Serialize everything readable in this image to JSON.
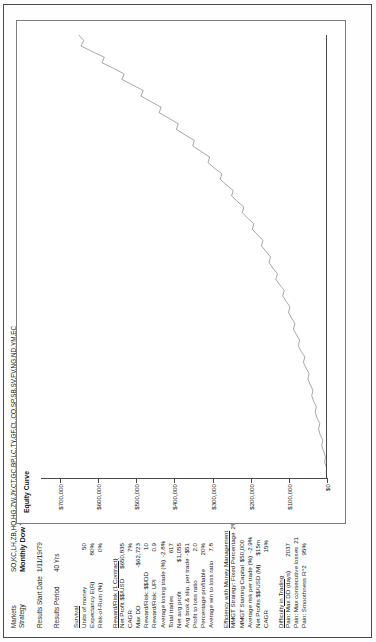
{
  "header": {
    "markets_label": "Markets",
    "markets_value": "SO,KC,LH,ZB,HO,HG,ZW,JY,CT,GC,BP,LC,TY,GF,CL,CO,SP,SB,SV,FV,NG,ND,YM,EC",
    "strategy_label": "Strategy",
    "strategy_value": "Monthly Dow Trader w/LF and 2 Stop Trade Plan",
    "results_start_date_label": "Results Start Date",
    "results_start_date_value": "1/11/19/79",
    "results_period_label": "Results Period",
    "results_period_value": "40 Yrs"
  },
  "stats": [
    {
      "title": "Survival",
      "rows": [
        {
          "label": "Units of money",
          "value": "50"
        },
        {
          "label": "Expectancy E(R)",
          "value": "80%"
        },
        {
          "label": "Risk-of-Ruin (%)",
          "value": "0%"
        }
      ]
    },
    {
      "title": "Reward/Risk (1 Contract)",
      "rows": [
        {
          "label": "Net Profit $$/USD",
          "value": "$650,835"
        },
        {
          "label": "CAGR",
          "value": "7%"
        },
        {
          "label": "Max DD",
          "value": "-$62,723"
        },
        {
          "label": "Reward/Risk: $$/DD",
          "value": "10"
        },
        {
          "label": "Reward/Risk: UPI",
          "value": "0.9"
        },
        {
          "label": "Average losing trade (%)",
          "value": "-2.8%"
        },
        {
          "label": "Total trades",
          "value": "617"
        },
        {
          "label": "Net avg profit",
          "value": "$1,055"
        },
        {
          "label": "Avg brok.& slip. per trade",
          "value": "-$51"
        },
        {
          "label": "Profit to loss ratio",
          "value": "2.0"
        },
        {
          "label": "Percentage profitable",
          "value": "20%"
        },
        {
          "label": "Average win to loss ratio",
          "value": "7.8"
        }
      ]
    },
    {
      "title": "Efficiency with Money Management",
      "rows": [
        {
          "label": "MMGT Strategy: Fixed Percentage",
          "value": "2%"
        },
        {
          "label": "MMGT Starting Capital",
          "value": "$50,000"
        },
        {
          "label": "Average risk per trade (%)",
          "value": "-2.9%"
        },
        {
          "label": "Net Profits $$/USD (M)",
          "value": "$15m"
        },
        {
          "label": "CAGR",
          "value": "15%"
        }
      ]
    },
    {
      "title": "Difficulty in Trading",
      "rows": [
        {
          "label": "Pain: Max DD (days)",
          "value": "2037"
        },
        {
          "label": "Pain: Max consecutive losses",
          "value": "21"
        },
        {
          "label": "Pain: Smoothness R^2",
          "value": "95%"
        }
      ]
    }
  ],
  "chart_data": {
    "type": "line",
    "title": "Equity Curve",
    "xlabel": "",
    "ylabel": "",
    "ylim": [
      0,
      750000
    ],
    "grid": false,
    "legend": "none",
    "ytick_labels": [
      "$700,000",
      "$600,000",
      "$500,000",
      "$400,000",
      "$300,000",
      "$200,000",
      "$100,000",
      "$0"
    ],
    "ytick_values": [
      700000,
      600000,
      500000,
      400000,
      300000,
      200000,
      100000,
      0
    ],
    "series": [
      {
        "name": "Equity",
        "x": [
          0,
          1,
          2,
          3,
          4,
          5,
          6,
          7,
          8,
          9,
          10,
          11,
          12,
          13,
          14,
          15,
          16,
          17,
          18,
          19,
          20,
          21,
          22,
          23,
          24,
          25,
          26,
          27,
          28,
          29,
          30,
          31,
          32,
          33,
          34,
          35,
          36,
          37,
          38,
          39,
          40,
          41,
          42,
          43,
          44,
          45,
          46,
          47,
          48,
          49,
          50,
          51,
          52,
          53,
          54,
          55,
          56,
          57,
          58,
          59,
          60,
          61,
          62,
          63,
          64,
          65,
          66,
          67,
          68,
          69,
          70,
          71,
          72,
          73,
          74,
          75,
          76,
          77,
          78,
          79,
          80
        ],
        "values": [
          0,
          2000,
          1000,
          6000,
          4000,
          9000,
          14000,
          11000,
          18000,
          22000,
          19000,
          26000,
          31000,
          28000,
          35000,
          40000,
          37000,
          44000,
          50000,
          47000,
          55000,
          62000,
          58000,
          68000,
          75000,
          72000,
          80000,
          88000,
          84000,
          93000,
          101000,
          97000,
          107000,
          116000,
          112000,
          124000,
          134000,
          130000,
          142000,
          152000,
          148000,
          160000,
          172000,
          168000,
          182000,
          196000,
          192000,
          208000,
          222000,
          218000,
          235000,
          250000,
          246000,
          264000,
          280000,
          276000,
          295000,
          312000,
          308000,
          330000,
          352000,
          348000,
          372000,
          395000,
          390000,
          415000,
          440000,
          435000,
          462000,
          488000,
          482000,
          510000,
          538000,
          532000,
          560000,
          590000,
          584000,
          615000,
          645000,
          638000,
          650835
        ]
      }
    ]
  }
}
